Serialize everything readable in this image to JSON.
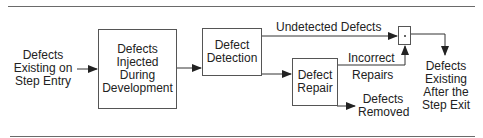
{
  "diagram": {
    "entry_label": [
      "Defects",
      "Existing on",
      "Step Entry"
    ],
    "boxes": {
      "injected": [
        "Defects",
        "Injected",
        "During",
        "Development"
      ],
      "detection": [
        "Defect",
        "Detection"
      ],
      "repair": [
        "Defect",
        "Repair"
      ]
    },
    "edges": {
      "undetected": "Undetected Defects",
      "incorrect_1": "Incorrect",
      "incorrect_2": "Repairs",
      "removed_1": "Defects",
      "removed_2": "Removed"
    },
    "junction_symbol": "·",
    "exit_label": [
      "Defects",
      "Existing",
      "After the",
      "Step Exit"
    ],
    "colors": {
      "line": "#333333",
      "box_border": "#555555",
      "rule": "#6a6a6a",
      "text": "#222222"
    }
  }
}
